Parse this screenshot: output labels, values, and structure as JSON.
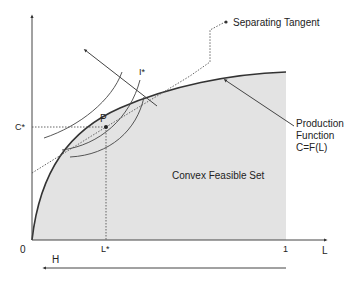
{
  "diagram": {
    "labels": {
      "origin": "0",
      "x_axis": "L",
      "x_one": "1",
      "l_star": "L*",
      "c_star": "C*",
      "point_p": "P",
      "indifference": "I*",
      "separating_tangent": "Separating Tangent",
      "production_line1": "Production",
      "production_line2": "Function",
      "production_line3": "C=F(L)",
      "feasible_set": "Convex Feasible Set",
      "leisure_arrow": "H"
    },
    "colors": {
      "feasible_fill": "#e3e3e3",
      "line": "#333333",
      "dotted": "#555555"
    }
  }
}
